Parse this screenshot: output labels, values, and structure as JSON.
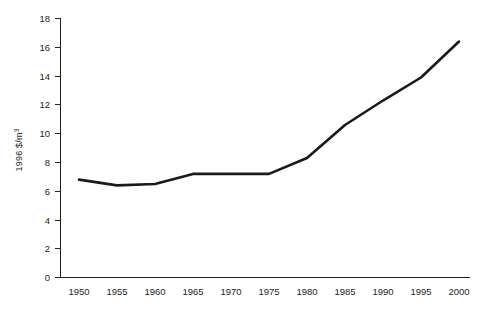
{
  "chart_data": {
    "type": "line",
    "title": "",
    "subtitle": "",
    "xlabel": "",
    "ylabel": "1996 $/m",
    "ylabel_superscript": "3",
    "ylabel_full": "1996 $/m³",
    "x": [
      1950,
      1955,
      1960,
      1965,
      1970,
      1975,
      1980,
      1985,
      1990,
      1995,
      2000
    ],
    "xtick_labels": [
      "1950",
      "1955",
      "1960",
      "1965",
      "1970",
      "1975",
      "1980",
      "1985",
      "1990",
      "1995",
      "2000"
    ],
    "values": [
      6.8,
      6.4,
      6.5,
      7.2,
      7.2,
      7.2,
      8.3,
      10.6,
      12.3,
      13.9,
      16.4
    ],
    "series": [
      {
        "name": "1996 $/m³",
        "values": [
          6.8,
          6.4,
          6.5,
          7.2,
          7.2,
          7.2,
          8.3,
          10.6,
          12.3,
          13.9,
          16.4
        ]
      }
    ],
    "ytick_labels": [
      "0",
      "2",
      "4",
      "6",
      "8",
      "10",
      "12",
      "14",
      "16",
      "18"
    ],
    "ytick_values": [
      0,
      2,
      4,
      6,
      8,
      10,
      12,
      14,
      16,
      18
    ],
    "ylim": [
      0,
      18
    ],
    "xlim": [
      1950,
      2000
    ],
    "grid": false,
    "legend": false,
    "legend_position": "none",
    "line_color": "#1a1a1a",
    "axis_color": "#231f20",
    "background_color": "#ffffff"
  }
}
